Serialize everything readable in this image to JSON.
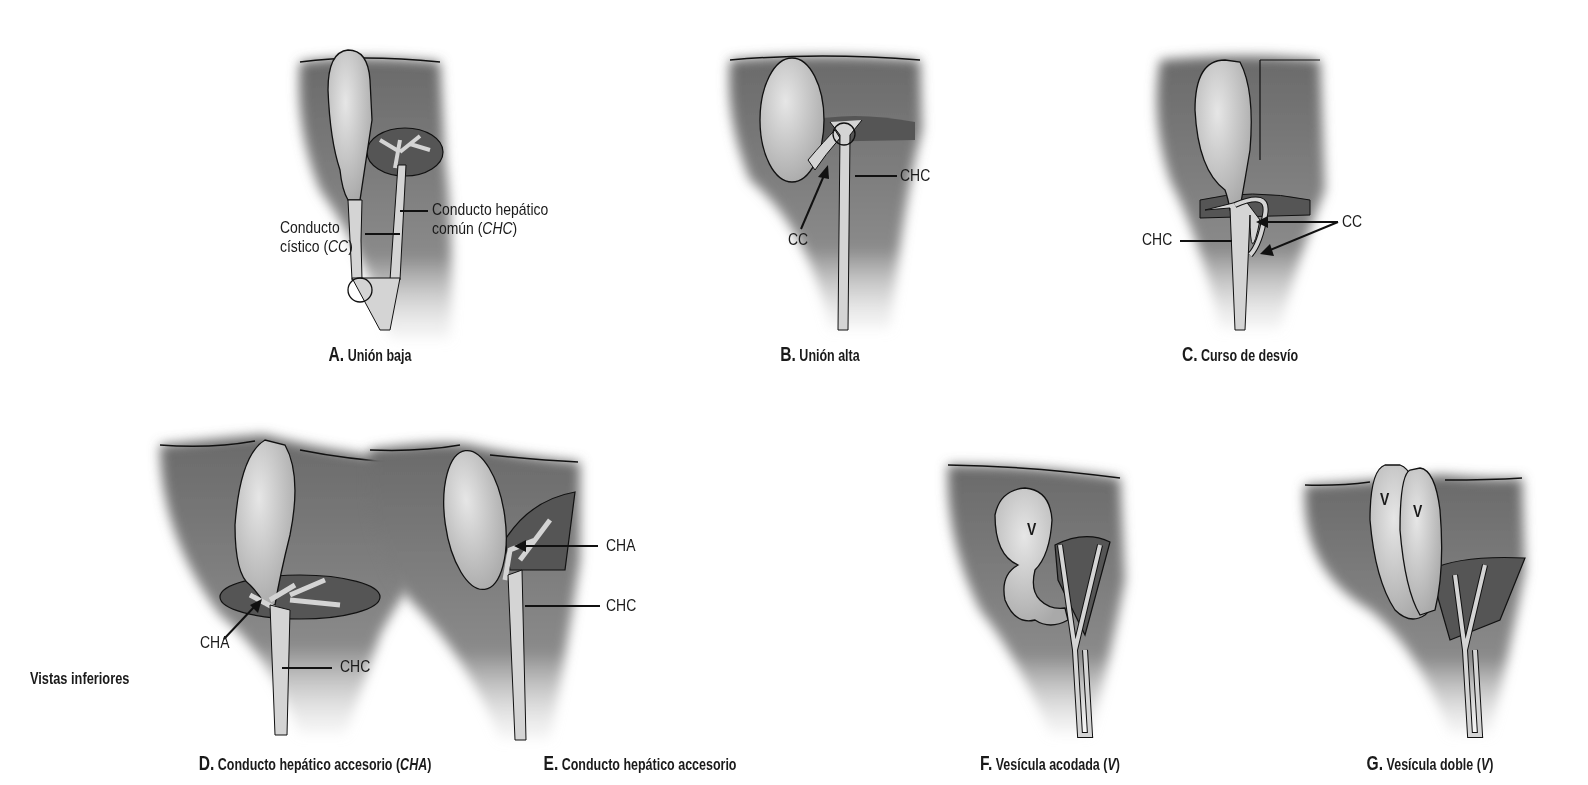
{
  "figure": {
    "side_label": "Vistas inferiores",
    "colors": {
      "liver": "#6f6f6f",
      "liver_dark": "#4e4e4e",
      "gallbladder": "#c9c9c9",
      "duct": "#d4d4d4",
      "outline": "#111111",
      "text": "#1a1a1a"
    },
    "panels": [
      {
        "id": "A",
        "letter": "A.",
        "title": "Unión baja",
        "labels": {
          "cc_line1": "Conducto",
          "cc_line2": "cístico (",
          "cc_abbr": "CC",
          "cc_close": ")",
          "chc_line1": "Conducto hepático",
          "chc_line2": "común (",
          "chc_abbr": "CHC",
          "chc_close": ")"
        }
      },
      {
        "id": "B",
        "letter": "B.",
        "title": "Unión alta",
        "labels": {
          "cc": "CC",
          "chc": "CHC"
        }
      },
      {
        "id": "C",
        "letter": "C.",
        "title": "Curso de desvío",
        "labels": {
          "cc": "CC",
          "chc": "CHC"
        }
      },
      {
        "id": "D",
        "letter": "D.",
        "title": "Conducto hepático accesorio (",
        "title_abbr": "CHA",
        "title_close": ")",
        "labels": {
          "cha": "CHA",
          "chc": "CHC"
        }
      },
      {
        "id": "E",
        "letter": "E.",
        "title": "Conducto hepático accesorio",
        "labels": {
          "cha": "CHA",
          "chc": "CHC"
        }
      },
      {
        "id": "F",
        "letter": "F.",
        "title": "Vesícula acodada (",
        "title_abbr": "V",
        "title_close": ")",
        "labels": {
          "v": "V"
        }
      },
      {
        "id": "G",
        "letter": "G.",
        "title": "Vesícula doble (",
        "title_abbr": "V",
        "title_close": ")",
        "labels": {
          "v1": "V",
          "v2": "V"
        }
      }
    ]
  }
}
